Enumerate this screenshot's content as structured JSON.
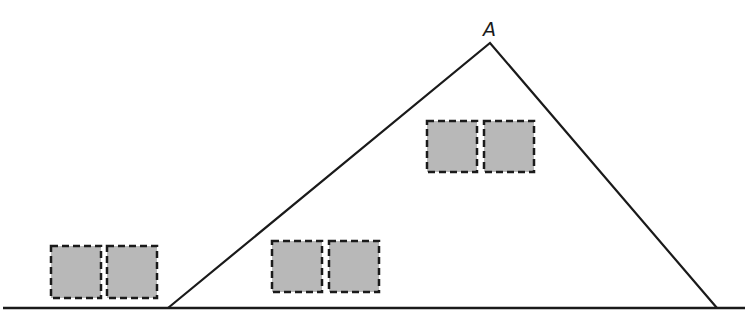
{
  "diagram": {
    "background": "#ffffff",
    "line_color": "#1a1a1a",
    "box_fill": "#b8b8b8",
    "box_stroke": "#1a1a1a",
    "ground_line": {
      "x1": 3,
      "y1": 308,
      "x2": 745,
      "y2": 308
    },
    "triangle": {
      "left_base": {
        "x": 168,
        "y": 308
      },
      "apex": {
        "x": 490,
        "y": 43
      },
      "right_base": {
        "x": 717,
        "y": 308
      }
    },
    "apex_label": {
      "text": "A",
      "x": 483,
      "y": 20
    },
    "box_pairs": [
      {
        "name": "left-ground-pair",
        "boxes": [
          {
            "x": 51,
            "y": 246,
            "w": 50,
            "h": 52
          },
          {
            "x": 107,
            "y": 246,
            "w": 50,
            "h": 52
          }
        ]
      },
      {
        "name": "inside-bottom-pair",
        "boxes": [
          {
            "x": 272,
            "y": 241,
            "w": 50,
            "h": 51
          },
          {
            "x": 329,
            "y": 241,
            "w": 50,
            "h": 51
          }
        ]
      },
      {
        "name": "inside-top-pair",
        "boxes": [
          {
            "x": 427,
            "y": 121,
            "w": 50,
            "h": 51
          },
          {
            "x": 484,
            "y": 121,
            "w": 50,
            "h": 51
          }
        ]
      }
    ]
  }
}
